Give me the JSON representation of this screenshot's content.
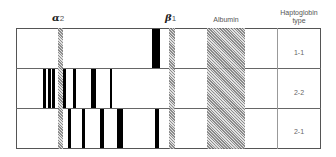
{
  "header": {
    "alpha_label": "α",
    "alpha_sub": "2",
    "beta_label": "β",
    "beta_sub": "1",
    "albumin_label": "Albumin",
    "type_label_line1": "Haptoglobin",
    "type_label_line2": "type"
  },
  "rows": [
    {
      "type": "1-1",
      "bands": [
        {
          "x": 152,
          "w": 8
        }
      ]
    },
    {
      "type": "2-2",
      "bands": [
        {
          "x": 43,
          "w": 3
        },
        {
          "x": 48,
          "w": 3
        },
        {
          "x": 52,
          "w": 3
        },
        {
          "x": 63,
          "w": 3
        },
        {
          "x": 73,
          "w": 3
        },
        {
          "x": 91,
          "w": 5
        },
        {
          "x": 110,
          "w": 2
        }
      ]
    },
    {
      "type": "2-1",
      "bands": [
        {
          "x": 68,
          "w": 3
        },
        {
          "x": 82,
          "w": 3
        },
        {
          "x": 100,
          "w": 4
        },
        {
          "x": 117,
          "w": 6
        },
        {
          "x": 155,
          "w": 4
        }
      ]
    }
  ],
  "colors": {
    "band": "#000000",
    "hatch": "#888888",
    "border": "#555555"
  }
}
